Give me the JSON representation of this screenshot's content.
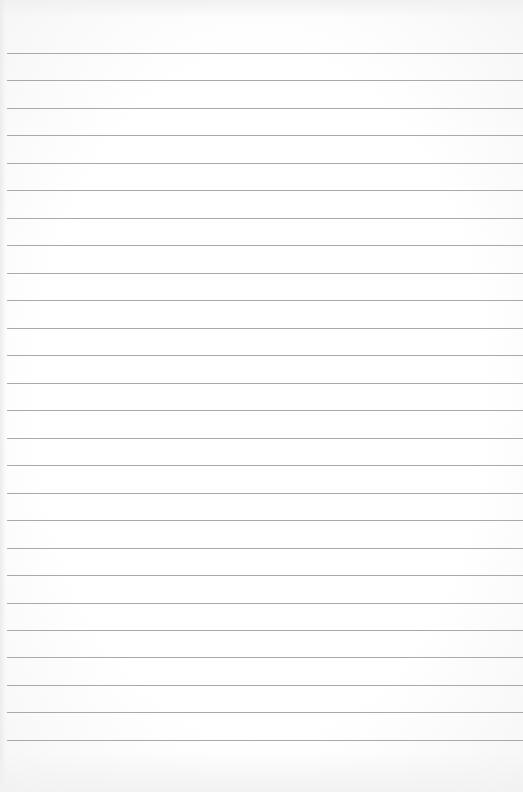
{
  "page": {
    "type": "blank lined paper",
    "background_color": "#fdfdfd",
    "rule_color": "#a9a9a9",
    "rule_left_margin_px": 7,
    "rule_count": 26,
    "rules_y": [
      53,
      80,
      108,
      135,
      163,
      190,
      218,
      245,
      273,
      300,
      328,
      355,
      383,
      410,
      438,
      465,
      493,
      520,
      548,
      575,
      603,
      630,
      657,
      685,
      712,
      740
    ]
  }
}
